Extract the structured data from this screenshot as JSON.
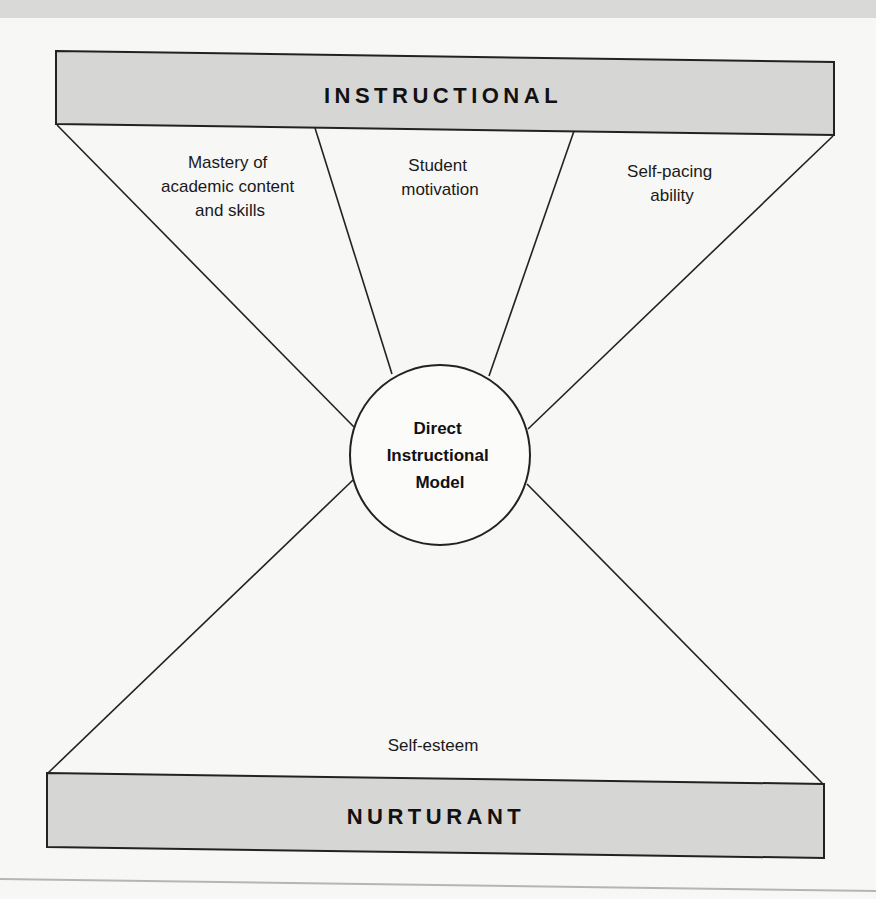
{
  "diagram": {
    "top_box": {
      "label": "INSTRUCTIONAL"
    },
    "bottom_box": {
      "label": "NURTURANT"
    },
    "center": {
      "lines": [
        "Direct",
        "Instructional",
        "Model"
      ]
    },
    "top_segments": [
      {
        "lines": [
          "Mastery of",
          "academic content",
          "and skills"
        ]
      },
      {
        "lines": [
          "Student",
          "motivation"
        ]
      },
      {
        "lines": [
          "Self-pacing",
          "ability"
        ]
      }
    ],
    "bottom_segment": {
      "lines": [
        "Self-esteem"
      ]
    }
  },
  "colors": {
    "box_fill": "#d6d6d5",
    "stroke": "#222222",
    "background": "#f7f7f6"
  }
}
